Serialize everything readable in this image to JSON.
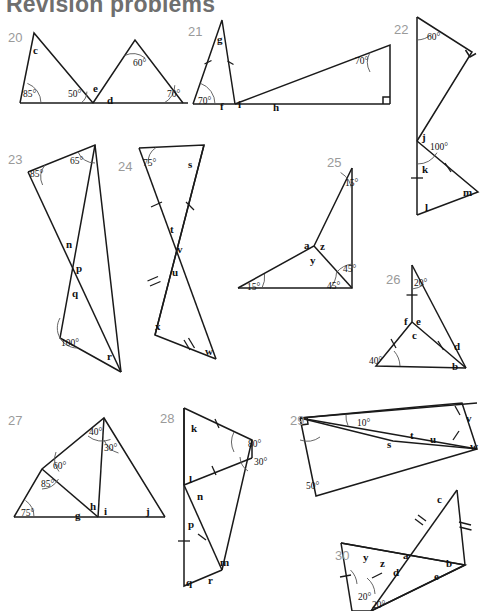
{
  "page": {
    "title": "Revision problems",
    "width": 492,
    "height": 611,
    "background": "#ffffff",
    "ink": "#1a1a1a",
    "number_color": "#9a9a9a"
  },
  "figures": [
    {
      "number": "20",
      "num_pos": [
        8,
        30
      ],
      "letters": [
        {
          "text": "c",
          "x": 33,
          "y": 44
        },
        {
          "text": "e",
          "x": 93,
          "y": 82
        },
        {
          "text": "d",
          "x": 107,
          "y": 94
        }
      ],
      "angles": [
        {
          "text": "85°",
          "x": 23,
          "y": 89
        },
        {
          "text": "50°",
          "x": 68,
          "y": 89
        },
        {
          "text": "60°",
          "x": 133,
          "y": 58
        },
        {
          "text": "70°",
          "x": 167,
          "y": 89
        }
      ]
    },
    {
      "number": "21",
      "num_pos": [
        188,
        24
      ],
      "letters": [
        {
          "text": "g",
          "x": 217,
          "y": 33
        },
        {
          "text": "f",
          "x": 220,
          "y": 100
        },
        {
          "text": "i",
          "x": 238,
          "y": 98
        },
        {
          "text": "h",
          "x": 273,
          "y": 101
        }
      ],
      "angles": [
        {
          "text": "70°",
          "x": 198,
          "y": 96
        },
        {
          "text": "70°",
          "x": 355,
          "y": 56
        }
      ]
    },
    {
      "number": "22",
      "num_pos": [
        394,
        22
      ],
      "letters": [
        {
          "text": "j",
          "x": 422,
          "y": 131
        },
        {
          "text": "k",
          "x": 422,
          "y": 163
        },
        {
          "text": "l",
          "x": 425,
          "y": 201
        },
        {
          "text": "m",
          "x": 463,
          "y": 186
        }
      ],
      "angles": [
        {
          "text": "60°",
          "x": 427,
          "y": 32
        },
        {
          "text": "100°",
          "x": 430,
          "y": 142
        }
      ]
    },
    {
      "number": "23",
      "num_pos": [
        8,
        152
      ],
      "letters": [
        {
          "text": "n",
          "x": 66,
          "y": 238
        },
        {
          "text": "p",
          "x": 76,
          "y": 262
        },
        {
          "text": "q",
          "x": 72,
          "y": 287
        },
        {
          "text": "r",
          "x": 107,
          "y": 350
        }
      ],
      "angles": [
        {
          "text": "85°",
          "x": 30,
          "y": 169
        },
        {
          "text": "65°",
          "x": 70,
          "y": 156
        },
        {
          "text": "100°",
          "x": 61,
          "y": 338
        }
      ]
    },
    {
      "number": "24",
      "num_pos": [
        118,
        159
      ],
      "letters": [
        {
          "text": "s",
          "x": 188,
          "y": 158
        },
        {
          "text": "t",
          "x": 170,
          "y": 223
        },
        {
          "text": "v",
          "x": 177,
          "y": 243
        },
        {
          "text": "u",
          "x": 172,
          "y": 266
        },
        {
          "text": "x",
          "x": 155,
          "y": 320
        },
        {
          "text": "w",
          "x": 205,
          "y": 345
        }
      ],
      "angles": [
        {
          "text": "75°",
          "x": 143,
          "y": 158
        }
      ]
    },
    {
      "number": "25",
      "num_pos": [
        327,
        155
      ],
      "letters": [
        {
          "text": "a",
          "x": 304,
          "y": 239
        },
        {
          "text": "z",
          "x": 320,
          "y": 240
        },
        {
          "text": "y",
          "x": 310,
          "y": 254
        }
      ],
      "angles": [
        {
          "text": "15°",
          "x": 345,
          "y": 178
        },
        {
          "text": "15°",
          "x": 247,
          "y": 282
        },
        {
          "text": "45°",
          "x": 343,
          "y": 264
        },
        {
          "text": "45°",
          "x": 327,
          "y": 281
        }
      ]
    },
    {
      "number": "26",
      "num_pos": [
        386,
        272
      ],
      "letters": [
        {
          "text": "f",
          "x": 404,
          "y": 315
        },
        {
          "text": "e",
          "x": 416,
          "y": 315
        },
        {
          "text": "c",
          "x": 412,
          "y": 329
        },
        {
          "text": "d",
          "x": 454,
          "y": 340
        },
        {
          "text": "b",
          "x": 452,
          "y": 360
        }
      ],
      "angles": [
        {
          "text": "20°",
          "x": 414,
          "y": 278
        },
        {
          "text": "40°",
          "x": 369,
          "y": 356
        }
      ]
    },
    {
      "number": "27",
      "num_pos": [
        8,
        413
      ],
      "letters": [
        {
          "text": "g",
          "x": 75,
          "y": 509
        },
        {
          "text": "h",
          "x": 90,
          "y": 500
        },
        {
          "text": "i",
          "x": 104,
          "y": 505
        },
        {
          "text": "j",
          "x": 146,
          "y": 505
        }
      ],
      "angles": [
        {
          "text": "40°",
          "x": 89,
          "y": 427
        },
        {
          "text": "30°",
          "x": 104,
          "y": 443
        },
        {
          "text": "60°",
          "x": 53,
          "y": 461
        },
        {
          "text": "85°",
          "x": 41,
          "y": 479
        },
        {
          "text": "75°",
          "x": 21,
          "y": 508
        }
      ]
    },
    {
      "number": "28",
      "num_pos": [
        160,
        411
      ],
      "letters": [
        {
          "text": "k",
          "x": 191,
          "y": 422
        },
        {
          "text": "l",
          "x": 189,
          "y": 473
        },
        {
          "text": "n",
          "x": 197,
          "y": 490
        },
        {
          "text": "p",
          "x": 188,
          "y": 518
        },
        {
          "text": "m",
          "x": 220,
          "y": 556
        },
        {
          "text": "q",
          "x": 186,
          "y": 576
        },
        {
          "text": "r",
          "x": 208,
          "y": 574
        }
      ],
      "angles": [
        {
          "text": "80°",
          "x": 248,
          "y": 439
        },
        {
          "text": "30°",
          "x": 254,
          "y": 457
        }
      ]
    },
    {
      "number": "29",
      "num_pos": [
        290,
        413
      ],
      "letters": [
        {
          "text": "s",
          "x": 387,
          "y": 438
        },
        {
          "text": "t",
          "x": 410,
          "y": 429
        },
        {
          "text": "u",
          "x": 430,
          "y": 433
        },
        {
          "text": "v",
          "x": 466,
          "y": 412
        },
        {
          "text": "w",
          "x": 470,
          "y": 440
        }
      ],
      "angles": [
        {
          "text": "10°",
          "x": 357,
          "y": 418
        },
        {
          "text": "50°",
          "x": 306,
          "y": 481
        }
      ]
    },
    {
      "number": "30",
      "num_pos": [
        335,
        548
      ],
      "letters": [
        {
          "text": "c",
          "x": 437,
          "y": 493
        },
        {
          "text": "y",
          "x": 363,
          "y": 551
        },
        {
          "text": "z",
          "x": 380,
          "y": 557
        },
        {
          "text": "a",
          "x": 403,
          "y": 549
        },
        {
          "text": "d",
          "x": 393,
          "y": 566
        },
        {
          "text": "b",
          "x": 446,
          "y": 557
        },
        {
          "text": "e",
          "x": 434,
          "y": 570
        }
      ],
      "angles": [
        {
          "text": "20°",
          "x": 358,
          "y": 592
        },
        {
          "text": "20°",
          "x": 372,
          "y": 600
        }
      ]
    }
  ]
}
